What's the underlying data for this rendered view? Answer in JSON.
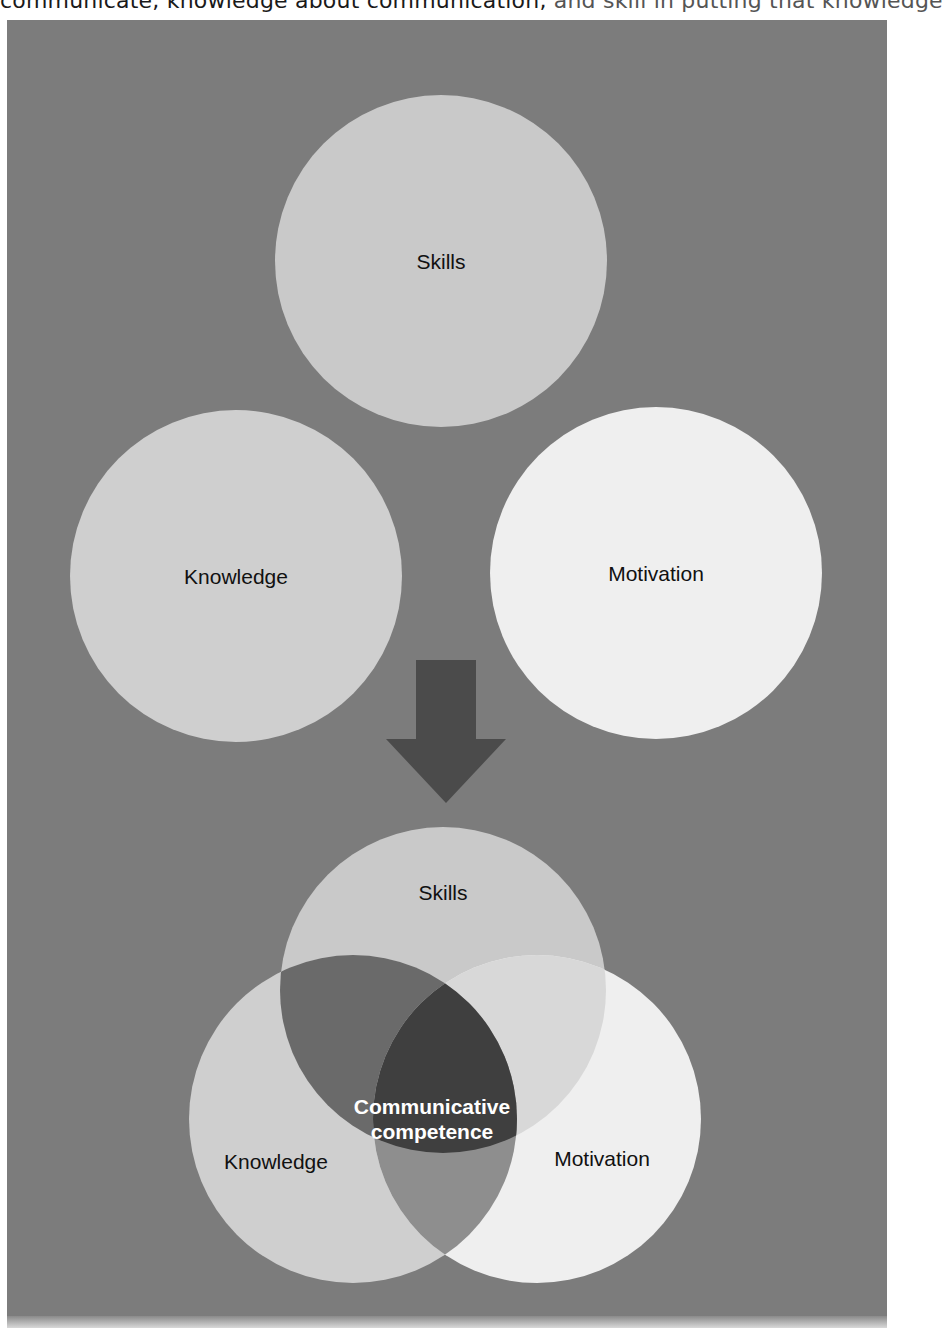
{
  "page": {
    "top_text_partial": "communicate, knowledge about communication, and skill in putting that knowledge",
    "top_text_main": "communicate, knowledge about communication,",
    "top_text_faded": " and skill in putting that knowledge"
  },
  "colors": {
    "panel_background": "#7c7c7c",
    "skills_circle": "#c9c9c9",
    "knowledge_circle": "#cfcfcf",
    "motivation_circle": "#efefef",
    "arrow": "#4b4b4b",
    "center_overlap": "#3f3f3f",
    "label_text": "#111111",
    "center_label_text": "#ffffff"
  },
  "diagram": {
    "separate": {
      "skills": {
        "label": "Skills"
      },
      "knowledge": {
        "label": "Knowledge"
      },
      "motivation": {
        "label": "Motivation"
      }
    },
    "arrow": {
      "direction": "down"
    },
    "venn": {
      "skills": {
        "label": "Skills"
      },
      "knowledge": {
        "label": "Knowledge"
      },
      "motivation": {
        "label": "Motivation"
      },
      "center": {
        "line1": "Communicative",
        "line2": "competence"
      }
    }
  }
}
